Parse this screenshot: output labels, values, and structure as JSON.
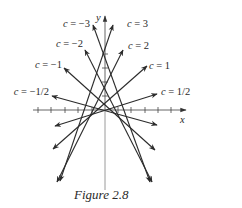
{
  "figure": {
    "caption": "Figure 2.8",
    "axes": {
      "x_label": "x",
      "y_label": "y",
      "origin_px": [
        105,
        110
      ],
      "x_axis_px": [
        33,
        186
      ],
      "y_axis_px": [
        190,
        16
      ],
      "x_ticks_px": [
        38,
        51,
        65,
        78,
        92,
        118,
        131,
        145,
        158,
        171
      ],
      "y_ticks_px": [
        96,
        82,
        68,
        54
      ]
    },
    "lines": [
      {
        "c": "3",
        "label": "c = 3",
        "from": [
          113,
          25
        ],
        "to": [
          60,
          181
        ],
        "label_pos": [
          127,
          27
        ],
        "anchor": "start"
      },
      {
        "c": "-3",
        "label": "c = −3",
        "from": [
          93,
          25
        ],
        "to": [
          150,
          182
        ],
        "label_pos": [
          90,
          27
        ],
        "anchor": "end"
      },
      {
        "c": "2",
        "label": "c = 2",
        "from": [
          123,
          50
        ],
        "to": [
          57,
          182
        ],
        "label_pos": [
          128,
          49
        ],
        "anchor": "start"
      },
      {
        "c": "-2",
        "label": "c = −2",
        "from": [
          85,
          50
        ],
        "to": [
          152,
          182
        ],
        "label_pos": [
          83,
          47
        ],
        "anchor": "end"
      },
      {
        "c": "1",
        "label": "c = 1",
        "from": [
          147,
          66
        ],
        "to": [
          53,
          149
        ],
        "label_pos": [
          149,
          69
        ],
        "anchor": "start"
      },
      {
        "c": "-1",
        "label": "c = −1",
        "from": [
          64,
          68
        ],
        "to": [
          155,
          150
        ],
        "label_pos": [
          62,
          68
        ],
        "anchor": "end"
      },
      {
        "c": "1/2",
        "label": "c = 1/2",
        "from": [
          157,
          94
        ],
        "to": [
          55,
          126
        ],
        "label_pos": [
          161,
          95
        ],
        "anchor": "start"
      },
      {
        "c": "-1/2",
        "label": "c = −1/2",
        "from": [
          52,
          96
        ],
        "to": [
          157,
          125
        ],
        "label_pos": [
          49,
          95
        ],
        "anchor": "end"
      }
    ],
    "colors": {
      "ink": "#2b2b2b",
      "axis_lower": "#9a9a9a",
      "background": "#ffffff"
    }
  }
}
